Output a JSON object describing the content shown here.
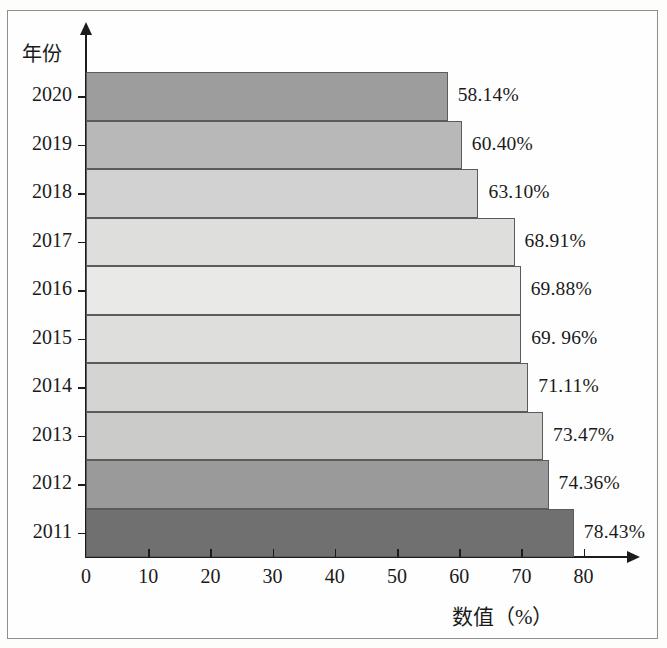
{
  "chart_data": {
    "type": "bar",
    "orientation": "horizontal",
    "title": "",
    "xlabel": "数值（%）",
    "ylabel": "年份",
    "categories": [
      "2020",
      "2019",
      "2018",
      "2017",
      "2016",
      "2015",
      "2014",
      "2013",
      "2012",
      "2011"
    ],
    "values": [
      58.14,
      60.4,
      63.1,
      68.91,
      69.88,
      69.96,
      71.11,
      73.47,
      74.36,
      78.43
    ],
    "data_labels": [
      "58.14%",
      "60.40%",
      "63.10%",
      "68.91%",
      "69.88%",
      "69. 96%",
      "71.11%",
      "73.47%",
      "74.36%",
      "78.43%"
    ],
    "bar_colors": [
      "#9d9d9d",
      "#b8b8b8",
      "#d2d2d2",
      "#dededd",
      "#e9e9e7",
      "#dededd",
      "#d4d4d3",
      "#cbcbca",
      "#9a9a9a",
      "#707070"
    ],
    "bar_border_color": "#5b5b5b",
    "xlim": [
      0,
      80
    ],
    "xticks": [
      "0",
      "10",
      "20",
      "30",
      "40",
      "50",
      "60",
      "70",
      "80"
    ],
    "xtick_values": [
      0,
      10,
      20,
      30,
      40,
      50,
      60,
      70,
      80
    ],
    "grid": false,
    "legend": false,
    "axis_color": "#1c1c1c",
    "background_color": "#fefefe"
  }
}
